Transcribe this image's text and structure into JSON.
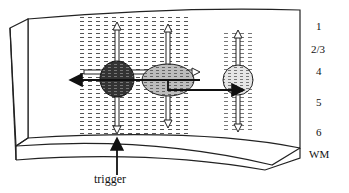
{
  "diagram": {
    "layers": [
      {
        "id": "l1",
        "label": "1",
        "y": 28
      },
      {
        "id": "l23",
        "label": "2/3",
        "y": 51
      },
      {
        "id": "l4",
        "label": "4",
        "y": 72
      },
      {
        "id": "l5",
        "label": "5",
        "y": 103
      },
      {
        "id": "l6",
        "label": "6",
        "y": 133
      },
      {
        "id": "wm",
        "label": "WM",
        "y": 154
      }
    ],
    "trigger_label": "trigger",
    "colors": {
      "dark_cell": "#3a3a3a",
      "mid_cell": "#b5b5b5",
      "light_cell": "#e2e2e2",
      "line": "#222222"
    }
  }
}
